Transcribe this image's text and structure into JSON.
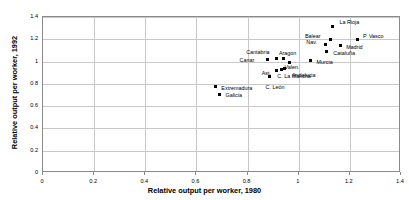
{
  "chart_data": {
    "type": "scatter",
    "title": "",
    "xlabel": "Relative output per worker, 1980",
    "ylabel": "Relative output per worker, 1992",
    "xlim": [
      0,
      1.4
    ],
    "ylim": [
      0,
      1.4
    ],
    "xticks": [
      "0",
      "0.2",
      "0.4",
      "0.6",
      "0.8",
      "1",
      "1.2",
      "1.4"
    ],
    "yticks": [
      "0",
      "0.2",
      "0.4",
      "0.6",
      "0.8",
      "1",
      "1.2",
      "1.4"
    ],
    "xtick_values": [
      0,
      0.2,
      0.4,
      0.6,
      0.8,
      1.0,
      1.2,
      1.4
    ],
    "ytick_values": [
      0,
      0.2,
      0.4,
      0.6,
      0.8,
      1.0,
      1.2,
      1.4
    ],
    "grid": true,
    "legend": "none",
    "marker_color": "#000000",
    "points": [
      {
        "label": "La Rioja",
        "x": 1.132,
        "y": 1.316,
        "lx": 7,
        "ly": -7
      },
      {
        "label": "Balear",
        "x": 1.126,
        "y": 1.196,
        "lx": -26,
        "ly": -7
      },
      {
        "label": "P. Vasco",
        "x": 1.228,
        "y": 1.198,
        "lx": 6,
        "ly": -7
      },
      {
        "label": "Nav.",
        "x": 1.104,
        "y": 1.152,
        "lx": -19,
        "ly": -6
      },
      {
        "label": "Madrid",
        "x": 1.162,
        "y": 1.14,
        "lx": 6,
        "ly": -2
      },
      {
        "label": "Cataluña",
        "x": 1.108,
        "y": 1.086,
        "lx": 7,
        "ly": -2
      },
      {
        "label": "Murcia",
        "x": 1.046,
        "y": 1.006,
        "lx": 6,
        "ly": -2
      },
      {
        "label": "Aragon",
        "x": 0.942,
        "y": 1.028,
        "lx": -5,
        "ly": -8
      },
      {
        "label": "Cantabria",
        "x": 0.912,
        "y": 1.024,
        "lx": -30,
        "ly": -10
      },
      {
        "label": "Canar.",
        "x": 0.878,
        "y": 1.02,
        "lx": -28,
        "ly": -2
      },
      {
        "label": "Valen.",
        "x": 0.964,
        "y": 0.988,
        "lx": -5,
        "ly": 1
      },
      {
        "label": "Andalucia",
        "x": 0.946,
        "y": 0.936,
        "lx": 7,
        "ly": 3
      },
      {
        "label": "Ast.",
        "x": 0.914,
        "y": 0.922,
        "lx": -15,
        "ly": 0
      },
      {
        "label": "C. La Mancha",
        "x": 0.932,
        "y": 0.932,
        "lx": -4,
        "ly": 4
      },
      {
        "label": "C. León",
        "x": 0.886,
        "y": 0.868,
        "lx": -4,
        "ly": 8
      },
      {
        "label": "Extremadura",
        "x": 0.674,
        "y": 0.774,
        "lx": 6,
        "ly": -2
      },
      {
        "label": "Galicia",
        "x": 0.69,
        "y": 0.708,
        "lx": 6,
        "ly": -2
      }
    ]
  }
}
